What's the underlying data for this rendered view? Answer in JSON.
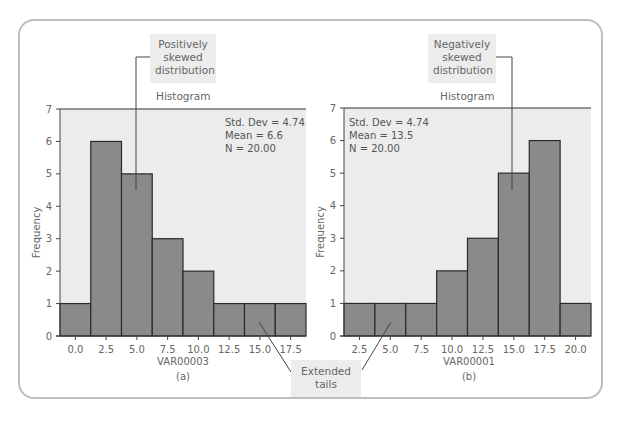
{
  "chart_data": [
    {
      "type": "bar",
      "id": "a",
      "title": "Histogram",
      "caption": "(a)",
      "xlabel": "VAR00003",
      "ylabel": "Frequency",
      "categories": [
        "0.0",
        "2.5",
        "5.0",
        "7.5",
        "10.0",
        "12.5",
        "15.0",
        "17.5"
      ],
      "values": [
        1,
        6,
        5,
        3,
        2,
        1,
        1,
        1
      ],
      "ylim": [
        0,
        7
      ],
      "yticks": [
        0,
        1,
        2,
        3,
        4,
        5,
        6,
        7
      ],
      "stats": [
        "Std. Dev = 4.74",
        "Mean = 6.6",
        "N = 20.00"
      ],
      "annotation": "Positively skewed distribution",
      "grid": false
    },
    {
      "type": "bar",
      "id": "b",
      "title": "Histogram",
      "caption": "(b)",
      "xlabel": "VAR00001",
      "ylabel": "Frequency",
      "categories": [
        "2.5",
        "5.0",
        "7.5",
        "10.0",
        "12.5",
        "15.0",
        "17.5",
        "20.0"
      ],
      "values": [
        1,
        1,
        1,
        2,
        3,
        5,
        6,
        1
      ],
      "ylim": [
        0,
        7
      ],
      "yticks": [
        0,
        1,
        2,
        3,
        4,
        5,
        6,
        7
      ],
      "stats": [
        "Std. Dev = 4.74",
        "Mean = 13.5",
        "N = 20.00"
      ],
      "annotation": "Negatively skewed distribution",
      "grid": false
    }
  ],
  "callouts": {
    "positive": [
      "Positively",
      "skewed",
      "distribution"
    ],
    "negative": [
      "Negatively",
      "skewed",
      "distribution"
    ],
    "tails": [
      "Extended",
      "tails"
    ]
  },
  "colors": {
    "bar_fill": "#8a8a8a",
    "bar_stroke": "#2a2a2a",
    "plot_bg": "#ececec",
    "callout_bg": "#ececec",
    "frame": "#bdbdbd"
  }
}
